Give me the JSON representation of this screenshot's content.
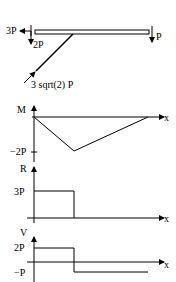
{
  "beam": {
    "load_left_horizontal": "3P",
    "load_left_vertical": "2P",
    "load_right_vertical": "P",
    "strut_force": "3 sqrt(2) P"
  },
  "moment_diagram": {
    "axis_label": "M",
    "x_label": "x",
    "tick_label": "−2P"
  },
  "r_diagram": {
    "axis_label": "R",
    "x_label": "x",
    "tick_label": "3P"
  },
  "shear_diagram": {
    "axis_label": "V",
    "x_label": "x",
    "tick_top": "2P",
    "tick_bottom": "−P"
  },
  "colors": {
    "line": "#000000",
    "background": "#ffffff"
  }
}
